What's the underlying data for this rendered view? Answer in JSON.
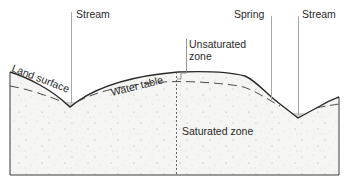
{
  "diagram": {
    "type": "groundwater-cross-section",
    "labels": {
      "stream_left": "Stream",
      "spring": "Spring",
      "stream_right": "Stream",
      "unsaturated_zone_line1": "Unsaturated",
      "unsaturated_zone_line2": "zone",
      "land_surface": "Land surface",
      "water_table": "Water table",
      "saturated_zone": "Saturated zone"
    },
    "colors": {
      "line": "#2a2a2a",
      "leader": "#a8a8a8",
      "ground_fill": "#f4f4f2",
      "stipple": "#b5b5b5",
      "water_fill": "#c9c9c9"
    }
  }
}
